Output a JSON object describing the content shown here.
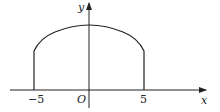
{
  "diagram": {
    "axes": {
      "x_label": "x",
      "y_label": "y",
      "origin_label": "O"
    },
    "ticks": [
      {
        "value": -5,
        "label": "−5"
      },
      {
        "value": 5,
        "label": "5"
      }
    ],
    "shape": {
      "description": "Region bounded by vertical segments at x=-5 and x=5 and an arc on top, symmetric about the y-axis",
      "left_x": -5,
      "right_x": 5
    },
    "colors": {
      "stroke": "#222222",
      "background": "#ffffff"
    }
  }
}
